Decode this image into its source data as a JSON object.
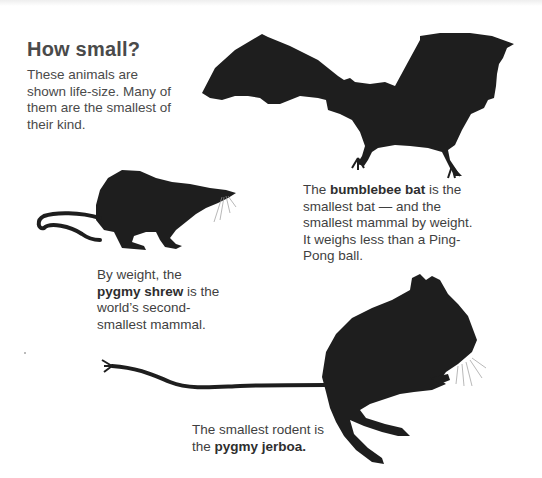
{
  "title": "How small?",
  "intro": "These animals are shown life-size. Many of them are the smallest of their kind.",
  "captions": {
    "bat": {
      "pre": "The ",
      "bold": "bumblebee bat",
      "post": " is the smallest bat — and the smallest mammal by weight. It weighs less than a Ping-Pong ball."
    },
    "shrew": {
      "pre": "By weight, the ",
      "bold": "pygmy shrew",
      "post": " is the world’s second-smallest mammal."
    },
    "jerboa": {
      "pre": "The smallest rodent is the ",
      "bold": "pygmy jerboa.",
      "post": ""
    }
  },
  "colors": {
    "silhouette": "#1e1e1e",
    "text": "#3f3f3f",
    "background": "#ffffff"
  }
}
